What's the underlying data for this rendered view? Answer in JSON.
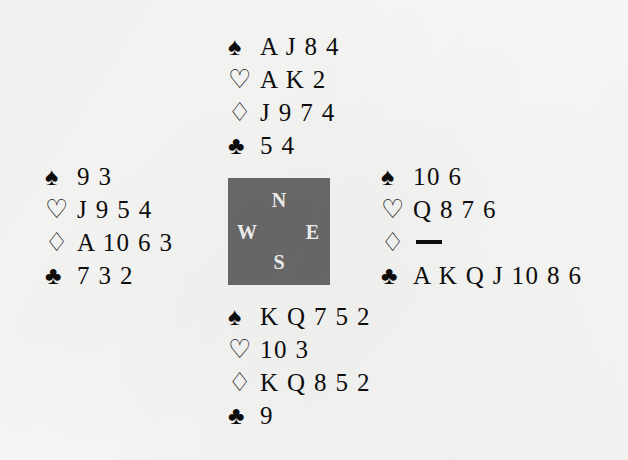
{
  "diagram": {
    "type": "bridge-hand-diagram",
    "background_color": "#f8f8f7",
    "ink_color": "#0d0d0d"
  },
  "suits": {
    "spade_symbol": "♠",
    "heart_symbol": "♡",
    "diamond_symbol": "♢",
    "club_symbol": "♣",
    "void_marker": "—"
  },
  "compass": {
    "background_color": "#6a6a6a",
    "text_color": "#f4f4f4",
    "north": "N",
    "west": "W",
    "east": "E",
    "south": "S"
  },
  "hands": {
    "north": {
      "position_label": "North",
      "spades": "A J 8 4",
      "hearts": "A K 2",
      "diamonds": "J 9 7 4",
      "clubs": "5 4"
    },
    "west": {
      "position_label": "West",
      "spades": "9 3",
      "hearts": "J 9 5 4",
      "diamonds": "A 10 6 3",
      "clubs": "7 3 2"
    },
    "east": {
      "position_label": "East",
      "spades": "10 6",
      "hearts": "Q 8 7 6",
      "diamonds": "",
      "diamonds_void": true,
      "clubs": "A K Q J 10 8 6"
    },
    "south": {
      "position_label": "South",
      "spades": "K Q 7 5 2",
      "hearts": "10 3",
      "diamonds": "K Q 8 5 2",
      "clubs": "9"
    }
  }
}
